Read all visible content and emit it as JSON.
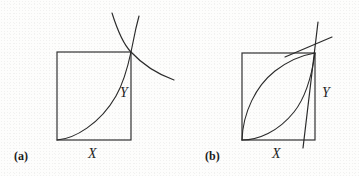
{
  "figure": {
    "background_color": "#fdfdfc",
    "ink_color": "#2b2b2b",
    "panels": [
      {
        "id": "a",
        "label": "(a)",
        "x_axis_label": "X",
        "y_axis_label": "Y",
        "box": {
          "left": 57,
          "top": 52,
          "right": 131,
          "bottom": 140
        },
        "curves": [
          {
            "name": "increasing-convex-curve",
            "description": "convex increasing curve from bottom-left corner of box to top-right corner, continuing above",
            "path": "M 57 140 C 74 139 100 124 116 96 C 124 82 128 66 131 52 L 136 28 L 139 16"
          },
          {
            "name": "decreasing-convex-curve",
            "description": "decreasing convex curve passing through the top-right corner of the box",
            "path": "M 112 13 C 118 32 124 45 131 52 C 144 66 160 75 174 80"
          }
        ]
      },
      {
        "id": "b",
        "label": "(b)",
        "x_axis_label": "X",
        "y_axis_label": "Y",
        "box": {
          "left": 242,
          "top": 53,
          "right": 315,
          "bottom": 140
        },
        "curves": [
          {
            "name": "concave-upper-curve",
            "description": "concave increasing curve from bottom-left corner bulging up toward top-right corner",
            "path": "M 242 140 C 243 112 256 86 275 71 C 288 61 303 55 315 53"
          },
          {
            "name": "convex-lower-curve",
            "description": "convex increasing curve from bottom-left corner sagging low then rising to top-right corner",
            "path": "M 242 140 C 258 140 278 132 294 112 C 306 97 312 74 315 53"
          },
          {
            "name": "steep-rising-line",
            "description": "steep nearly vertical short line crossing above the top-right corner",
            "path": "M 303 148 L 318 22"
          },
          {
            "name": "shallow-rising-line",
            "description": "shallow rising line crossing the steep line just above the corner",
            "path": "M 285 57 L 332 37"
          }
        ]
      }
    ]
  }
}
